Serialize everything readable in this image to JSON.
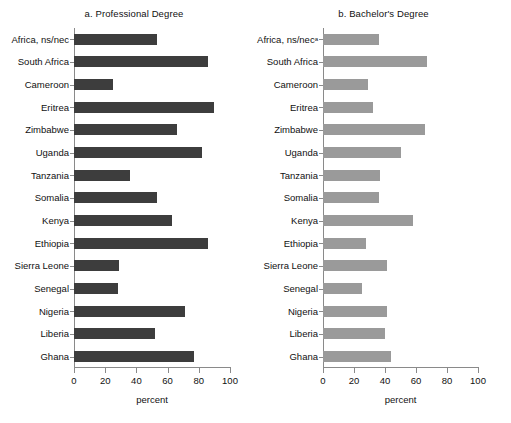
{
  "chart_data": [
    {
      "type": "bar",
      "orientation": "horizontal",
      "panel_id": "a",
      "title": "a. Professional Degree",
      "xlabel": "percent",
      "ylabel": "",
      "xlim": [
        0,
        100
      ],
      "xticks": [
        0,
        20,
        40,
        60,
        80,
        100
      ],
      "xticklabels": [
        "0",
        "20",
        "40",
        "60",
        "80",
        "100"
      ],
      "grid": false,
      "legend": "none",
      "bar_color": "#3d3d3d",
      "categories": [
        "Africa, ns/nec",
        "South Africa",
        "Cameroon",
        "Eritrea",
        "Zimbabwe",
        "Uganda",
        "Tanzania",
        "Somalia",
        "Kenya",
        "Ethiopia",
        "Sierra Leone",
        "Senegal",
        "Nigeria",
        "Liberia",
        "Ghana"
      ],
      "values": [
        53,
        86,
        25,
        90,
        66,
        82,
        36,
        53,
        63,
        86,
        29,
        28,
        71,
        52,
        77
      ]
    },
    {
      "type": "bar",
      "orientation": "horizontal",
      "panel_id": "b",
      "title": "b. Bachelor's Degree",
      "xlabel": "percent",
      "ylabel": "",
      "xlim": [
        0,
        100
      ],
      "xticks": [
        0,
        20,
        40,
        60,
        80,
        100
      ],
      "xticklabels": [
        "0",
        "20",
        "40",
        "60",
        "80",
        "100"
      ],
      "grid": false,
      "legend": "none",
      "bar_color": "#9a9a9a",
      "categories": [
        "Africa, ns/nec",
        "South Africa",
        "Cameroon",
        "Eritrea",
        "Zimbabwe",
        "Uganda",
        "Tanzania",
        "Somalia",
        "Kenya",
        "Ethiopia",
        "Sierra Leone",
        "Senegal",
        "Nigeria",
        "Liberia",
        "Ghana"
      ],
      "category_footnotes": [
        "a",
        "",
        "",
        "",
        "",
        "",
        "",
        "",
        "",
        "",
        "",
        "",
        "",
        "",
        ""
      ],
      "values": [
        36,
        67,
        29,
        32,
        66,
        50,
        37,
        36,
        58,
        28,
        41,
        25,
        41,
        40,
        44
      ]
    }
  ]
}
